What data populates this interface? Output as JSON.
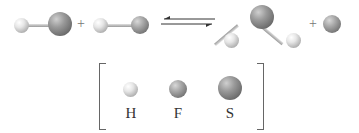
{
  "reaction": {
    "reactants": [
      "HS",
      "HF"
    ],
    "products": [
      "H2S",
      "F"
    ],
    "plus_sign": "+",
    "equilibrium_arrow": "⇌"
  },
  "legend": {
    "items": [
      {
        "symbol": "H",
        "label": "H"
      },
      {
        "symbol": "F",
        "label": "F"
      },
      {
        "symbol": "S",
        "label": "S"
      }
    ]
  }
}
